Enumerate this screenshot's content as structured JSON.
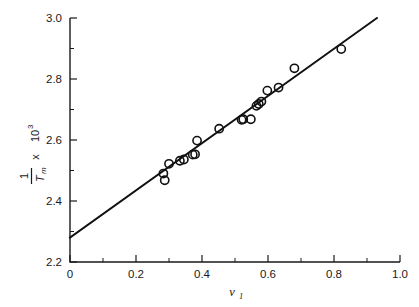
{
  "figure": {
    "title": "",
    "background_color": "#ffffff",
    "ink_color": "#111111"
  },
  "axes": {
    "x": {
      "label_main": "v",
      "label_sub": "1",
      "min": 0.0,
      "max": 1.0,
      "tick_labels": [
        "0",
        "0.2",
        "0.4",
        "0.6",
        "0.8",
        "1.0"
      ],
      "tick_values": [
        0.0,
        0.2,
        0.4,
        0.6,
        0.8,
        1.0
      ],
      "minor_tick_values": [
        0.1,
        0.3,
        0.5,
        0.7,
        0.9
      ]
    },
    "y": {
      "label_numerator": "1",
      "label_denominator": "T",
      "label_denominator_sub": "m",
      "label_times": "x",
      "label_base": "10",
      "label_exponent": "3",
      "min": 2.2,
      "max": 3.0,
      "tick_labels": [
        "2.2",
        "2.4",
        "2.6",
        "2.8",
        "3.0"
      ],
      "tick_values": [
        2.2,
        2.4,
        2.6,
        2.8,
        3.0
      ],
      "minor_tick_values": [
        2.3,
        2.5,
        2.7,
        2.9
      ]
    }
  },
  "chart_data": {
    "type": "scatter",
    "title": "",
    "xlabel": "v1",
    "ylabel": "(1/Tm) x 10^3",
    "xlim": [
      0.0,
      1.0
    ],
    "ylim": [
      2.2,
      3.0
    ],
    "grid": false,
    "legend": "none",
    "marker_style": "open-circle",
    "x": [
      0.283,
      0.287,
      0.3,
      0.333,
      0.345,
      0.372,
      0.379,
      0.385,
      0.452,
      0.52,
      0.525,
      0.548,
      0.565,
      0.572,
      0.58,
      0.598,
      0.632,
      0.68,
      0.822
    ],
    "y": [
      2.49,
      2.468,
      2.522,
      2.532,
      2.536,
      2.552,
      2.553,
      2.598,
      2.637,
      2.666,
      2.668,
      2.668,
      2.712,
      2.718,
      2.726,
      2.762,
      2.772,
      2.835,
      2.898
    ],
    "points": [
      {
        "x": 0.283,
        "y": 2.49
      },
      {
        "x": 0.287,
        "y": 2.468
      },
      {
        "x": 0.3,
        "y": 2.522
      },
      {
        "x": 0.333,
        "y": 2.532
      },
      {
        "x": 0.345,
        "y": 2.536
      },
      {
        "x": 0.372,
        "y": 2.552
      },
      {
        "x": 0.379,
        "y": 2.553
      },
      {
        "x": 0.385,
        "y": 2.598
      },
      {
        "x": 0.452,
        "y": 2.637
      },
      {
        "x": 0.52,
        "y": 2.666
      },
      {
        "x": 0.525,
        "y": 2.668
      },
      {
        "x": 0.548,
        "y": 2.668
      },
      {
        "x": 0.565,
        "y": 2.712
      },
      {
        "x": 0.572,
        "y": 2.718
      },
      {
        "x": 0.58,
        "y": 2.726
      },
      {
        "x": 0.598,
        "y": 2.762
      },
      {
        "x": 0.632,
        "y": 2.772
      },
      {
        "x": 0.68,
        "y": 2.835
      },
      {
        "x": 0.822,
        "y": 2.898
      }
    ],
    "series": [
      {
        "name": "data",
        "type": "scatter",
        "marker": "open-circle",
        "values": [
          2.49,
          2.468,
          2.522,
          2.532,
          2.536,
          2.552,
          2.553,
          2.598,
          2.637,
          2.666,
          2.668,
          2.668,
          2.712,
          2.718,
          2.726,
          2.762,
          2.772,
          2.835,
          2.898
        ]
      },
      {
        "name": "linear-fit",
        "type": "line",
        "intercept": 2.28,
        "slope": 0.775,
        "x_start": 0.0,
        "y_start": 2.28,
        "x_end": 0.93,
        "y_end": 3.0
      }
    ]
  }
}
